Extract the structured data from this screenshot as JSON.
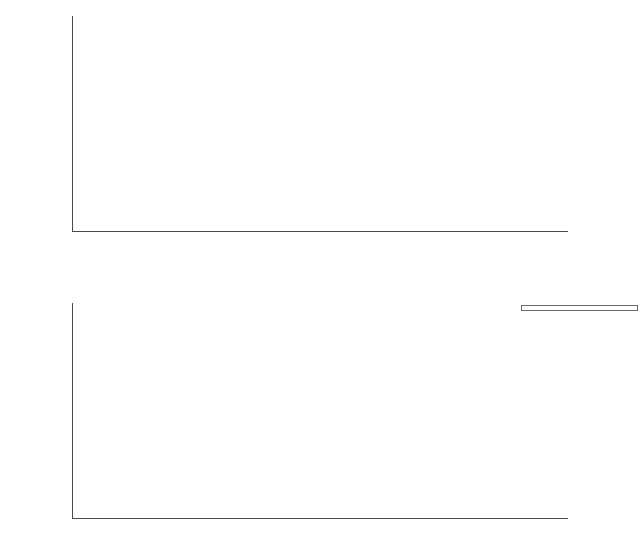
{
  "figure": {
    "ylabel_main": "mean CPUE (ind. × week",
    "ylabel_exp": "−1",
    "ylabel_close": ")"
  },
  "axis": {
    "yticks": [
      0,
      200,
      400,
      600,
      800,
      1000,
      1200,
      1400,
      1600,
      1800
    ],
    "ymin": 0,
    "ymax": 1800,
    "categories": [
      "Oct",
      "Nov",
      "Dec",
      "Jan",
      "Feb",
      "Mar",
      "Apr",
      "May",
      "Jun",
      "Jul",
      "Aug",
      "Sep",
      "Oct",
      "Nov"
    ]
  },
  "years": [
    {
      "label": "2013",
      "start_index": 0,
      "end_index": 2
    },
    {
      "label": "2014",
      "start_index": 3,
      "end_index": 13
    }
  ],
  "legend": {
    "items": [
      {
        "label": "Apendicularia",
        "color": "#5b3f9e"
      },
      {
        "label": "Benthic crustacea",
        "color": "#5a52ae"
      },
      {
        "label": "Bird",
        "color": "#6069c4"
      },
      {
        "label": "Chaetognatha",
        "color": "#62a3dd"
      },
      {
        "label": "Fish",
        "color": "#6bc2dc"
      },
      {
        "label": "Jellyfish",
        "color": "#8fd3bb"
      },
      {
        "label": "Mollusca",
        "color": "#a8d88c"
      },
      {
        "label": "Pelagic crustacea",
        "color": "#c3cf5f"
      },
      {
        "label": "Polychaeta",
        "color": "#f2d24b"
      },
      {
        "label": "Pteropoda",
        "color": "#f5e04a"
      },
      {
        "label": "Unidentified object",
        "color": "#f6ee55"
      }
    ]
  },
  "chart_data": [
    {
      "type": "bar",
      "title": "Total mean CPUE with standard deviation",
      "panel": "top",
      "xlabel": "",
      "ylabel": "mean CPUE (ind. × week⁻¹)",
      "ylim": [
        0,
        1800
      ],
      "grid": false,
      "bar_color": "#7b7fc4",
      "categories": [
        "Oct",
        "Nov",
        "Dec",
        "Jan",
        "Feb",
        "Mar",
        "Apr",
        "May",
        "Jun",
        "Jul",
        "Aug",
        "Sep",
        "Oct",
        "Nov"
      ],
      "years": [
        "2013",
        "2013",
        "2013",
        "2014",
        "2014",
        "2014",
        "2014",
        "2014",
        "2014",
        "2014",
        "2014",
        "2014",
        "2014",
        "2014"
      ],
      "values": [
        28,
        42,
        545,
        385,
        1455,
        480,
        450,
        3,
        6,
        4,
        78,
        200,
        40,
        45
      ],
      "error_upper": [
        60,
        95,
        755,
        655,
        1760,
        895,
        915,
        6,
        10,
        8,
        140,
        655,
        105,
        85
      ]
    },
    {
      "type": "bar",
      "subtype": "stacked",
      "panel": "bottom",
      "xlabel": "",
      "ylabel": "mean CPUE (ind. × week⁻¹)",
      "ylim": [
        0,
        1800
      ],
      "grid": false,
      "legend_position": "top-right",
      "categories": [
        "Oct",
        "Nov",
        "Dec",
        "Jan",
        "Feb",
        "Mar",
        "Apr",
        "May",
        "Jun",
        "Jul",
        "Aug",
        "Sep",
        "Oct",
        "Nov"
      ],
      "years": [
        "2013",
        "2013",
        "2013",
        "2014",
        "2014",
        "2014",
        "2014",
        "2014",
        "2014",
        "2014",
        "2014",
        "2014",
        "2014",
        "2014"
      ],
      "series": [
        {
          "name": "Apendicularia",
          "color": "#5b3f9e",
          "values": [
            0,
            0,
            0,
            0,
            0,
            0,
            0,
            0,
            0,
            0,
            0,
            0,
            0,
            0
          ]
        },
        {
          "name": "Benthic crustacea",
          "color": "#5a52ae",
          "values": [
            0,
            35,
            215,
            275,
            1100,
            140,
            150,
            2,
            4,
            2,
            55,
            245,
            30,
            38
          ]
        },
        {
          "name": "Bird",
          "color": "#6069c4",
          "values": [
            0,
            5,
            20,
            25,
            20,
            25,
            20,
            0,
            0,
            0,
            0,
            0,
            0,
            0
          ]
        },
        {
          "name": "Chaetognatha",
          "color": "#62a3dd",
          "values": [
            0,
            0,
            25,
            15,
            70,
            0,
            0,
            0,
            0,
            0,
            0,
            0,
            0,
            0
          ]
        },
        {
          "name": "Fish",
          "color": "#6bc2dc",
          "values": [
            28,
            5,
            20,
            15,
            45,
            15,
            10,
            0,
            0,
            0,
            23,
            0,
            10,
            5
          ]
        },
        {
          "name": "Jellyfish",
          "color": "#8fd3bb",
          "values": [
            0,
            0,
            15,
            15,
            200,
            200,
            230,
            0,
            0,
            0,
            0,
            0,
            0,
            0
          ]
        },
        {
          "name": "Mollusca",
          "color": "#a8d88c",
          "values": [
            0,
            10,
            10,
            15,
            10,
            0,
            0,
            0,
            0,
            0,
            0,
            0,
            0,
            0
          ]
        },
        {
          "name": "Pelagic crustacea",
          "color": "#c3cf5f",
          "values": [
            0,
            10,
            210,
            40,
            20,
            0,
            0,
            0,
            0,
            0,
            0,
            0,
            0,
            0
          ]
        },
        {
          "name": "Polychaeta",
          "color": "#f2d24b",
          "values": [
            0,
            0,
            0,
            5,
            15,
            0,
            0,
            0,
            0,
            0,
            0,
            0,
            0,
            0
          ]
        },
        {
          "name": "Pteropoda",
          "color": "#f5e04a",
          "values": [
            0,
            0,
            0,
            0,
            5,
            0,
            0,
            0,
            0,
            0,
            0,
            0,
            0,
            0
          ]
        },
        {
          "name": "Unidentified object",
          "color": "#f6ee55",
          "values": [
            0,
            0,
            85,
            0,
            0,
            170,
            190,
            0,
            0,
            0,
            0,
            0,
            0,
            0
          ]
        }
      ]
    }
  ]
}
